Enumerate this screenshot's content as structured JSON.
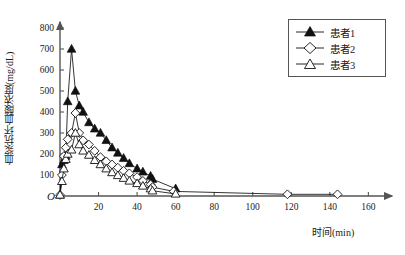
{
  "chart_data": {
    "type": "line",
    "title": "",
    "xlabel": "时间(min)",
    "ylabel": "血浆抗坏血酸浓度(mg/dL)",
    "xlim": [
      0,
      165
    ],
    "ylim": [
      0,
      800
    ],
    "grid": false,
    "legend_position": "top-right",
    "origin_label": "O",
    "xticks": [
      20,
      40,
      60,
      80,
      100,
      120,
      140,
      160
    ],
    "xtick_labels": [
      "20",
      "40",
      "60",
      "80",
      "100",
      "120",
      "140",
      "160"
    ],
    "yticks": [
      100,
      200,
      300,
      400,
      500,
      600,
      700,
      800
    ],
    "ytick_labels": [
      "100",
      "200",
      "300",
      "400",
      "500",
      "600",
      "700",
      "800"
    ],
    "series": [
      {
        "name": "患者1",
        "marker": "filled-triangle",
        "x": [
          0,
          1,
          2,
          3,
          4,
          6,
          8,
          10,
          12,
          15,
          18,
          21,
          24,
          27,
          30,
          33,
          36,
          40,
          43,
          47,
          48,
          60
        ],
        "values": [
          5,
          150,
          170,
          190,
          450,
          700,
          500,
          430,
          400,
          350,
          320,
          300,
          265,
          230,
          205,
          180,
          155,
          130,
          115,
          95,
          80,
          35
        ]
      },
      {
        "name": "患者2",
        "marker": "open-diamond",
        "x": [
          0,
          1,
          2,
          3,
          4,
          6,
          8,
          10,
          12,
          15,
          18,
          21,
          24,
          27,
          30,
          33,
          36,
          40,
          43,
          47,
          48,
          59,
          118,
          144
        ],
        "values": [
          5,
          100,
          190,
          230,
          270,
          300,
          395,
          300,
          265,
          245,
          215,
          185,
          165,
          150,
          135,
          120,
          108,
          90,
          72,
          55,
          42,
          22,
          8,
          8
        ]
      },
      {
        "name": "患者3",
        "marker": "open-triangle",
        "x": [
          0,
          1,
          2,
          3,
          4,
          6,
          8,
          10,
          12,
          15,
          18,
          21,
          24,
          27,
          30,
          33,
          36,
          40,
          43,
          47,
          48,
          60
        ],
        "values": [
          5,
          70,
          130,
          175,
          200,
          220,
          300,
          245,
          215,
          195,
          170,
          150,
          130,
          112,
          98,
          85,
          72,
          60,
          48,
          35,
          25,
          10
        ]
      }
    ]
  },
  "legend": {
    "items": [
      {
        "label": "患者1",
        "marker": "filled-triangle"
      },
      {
        "label": "患者2",
        "marker": "open-diamond"
      },
      {
        "label": "患者3",
        "marker": "open-triangle"
      }
    ]
  }
}
